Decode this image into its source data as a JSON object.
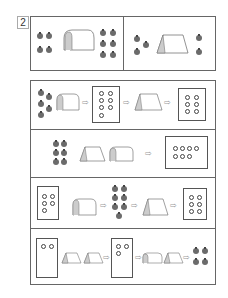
{
  "problem_number": "2",
  "top_panel": {
    "left": {
      "apples_before": 4,
      "tunnel": "arch-tunnel",
      "apples_after": 6
    },
    "right": {
      "apples_before": 3,
      "tunnel": "tent-tunnel",
      "apples_after": 2
    }
  },
  "rows": [
    {
      "start": "5 apples",
      "steps": [
        "arch-tunnel",
        "box 7 rings",
        "tent-tunnel",
        "box 6 rings"
      ]
    },
    {
      "start": "6 apples",
      "steps": [
        "tent-tunnel",
        "arch-tunnel",
        "box 7 rings"
      ]
    },
    {
      "start": "box 5 rings",
      "steps": [
        "arch-tunnel",
        "7 apples",
        "tent-tunnel",
        "box 6 rings"
      ]
    },
    {
      "start": "box 2 rings",
      "steps": [
        "tent-tunnel",
        "tent-tunnel",
        "box 3 rings",
        "arch-tunnel",
        "tent-tunnel",
        "4 apples"
      ]
    }
  ],
  "arrow_glyph": "⇨"
}
